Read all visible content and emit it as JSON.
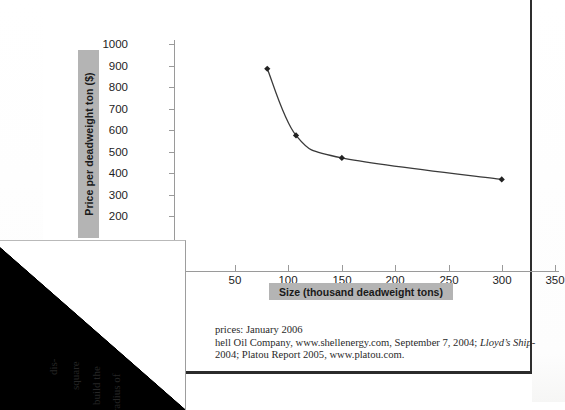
{
  "page": {
    "type": "scanned-textbook-page"
  },
  "chart_data": {
    "type": "line",
    "title": "",
    "xlabel": "Size (thousand deadweight tons)",
    "ylabel": "Price per deadweight ton ($)",
    "xlim": [
      0,
      350
    ],
    "ylim": [
      100,
      1000
    ],
    "xticks": [
      0,
      50,
      100,
      150,
      200,
      250,
      300,
      350
    ],
    "xtick_labels": [
      "0",
      "50",
      "100",
      "150",
      "200",
      "250",
      "300",
      "350"
    ],
    "yticks": [
      200,
      300,
      400,
      500,
      600,
      700,
      800,
      900,
      1000
    ],
    "ytick_labels": [
      "200",
      "300",
      "400",
      "500",
      "600",
      "700",
      "800",
      "900",
      "1000"
    ],
    "grid": false,
    "legend": null,
    "marker": "diamond",
    "line_color": "#3a3a3a",
    "marker_color": "#222222",
    "series": [
      {
        "name": "Price per deadweight ton",
        "x": [
          80,
          107,
          150,
          300
        ],
        "values": [
          885,
          575,
          470,
          370
        ]
      }
    ]
  },
  "axis_labels": {
    "y_title": "Price per deadweight ton ($)",
    "x_title": "Size (thousand deadweight tons)",
    "label_box_color": "#b4b4b4"
  },
  "caption": {
    "line1": "prices: January 2006",
    "line2_a": "hell Oil Company, www.shellenergy.com, September 7, 2004; ",
    "line2_italic": "Lloyd’s Ship-",
    "line3": "2004; Platou Report 2005, www.platou.com."
  },
  "corner_page": {
    "fragments": [
      "dis-",
      "square",
      "build the",
      "e radius of"
    ]
  }
}
